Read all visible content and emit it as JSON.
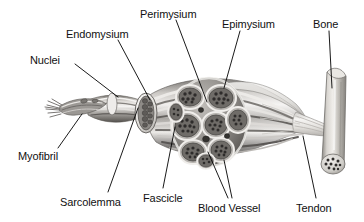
{
  "figure": {
    "style": "grayscale anatomical illustration",
    "background_color": "#ffffff",
    "label_color": "#111111",
    "leader_line_color": "#000000",
    "palette": {
      "muscle_light": "#e6e4e2",
      "muscle_mid": "#9b9894",
      "muscle_dark": "#4a4846",
      "sheath_light": "#f2f1ef",
      "bone_light": "#dcdad6",
      "bone_mid": "#a9a6a1",
      "tendon_light": "#eceae8",
      "outline": "#3d3b39"
    },
    "labels": [
      {
        "id": "nuclei",
        "text": "Nuclei",
        "x": 30,
        "y": 54,
        "leader": [
          [
            75,
            64
          ],
          [
            118,
            97
          ]
        ],
        "points_to": "nuclei on muscle fiber surface"
      },
      {
        "id": "endomysium",
        "text": "Endomysium",
        "x": 66,
        "y": 28,
        "leader": [
          [
            118,
            40
          ],
          [
            150,
            100
          ]
        ],
        "points_to": "endomysium sheath around muscle fiber"
      },
      {
        "id": "perimysium",
        "text": "Perimysium",
        "x": 140,
        "y": 8,
        "leader": [
          [
            176,
            20
          ],
          [
            207,
            102
          ]
        ],
        "points_to": "perimysium surrounding a fascicle"
      },
      {
        "id": "epimysium",
        "text": "Epimysium",
        "x": 222,
        "y": 18,
        "leader": [
          [
            240,
            31
          ],
          [
            224,
            88
          ]
        ],
        "points_to": "epimysium outer sheath of whole muscle"
      },
      {
        "id": "bone",
        "text": "Bone",
        "x": 313,
        "y": 18,
        "leader": [
          [
            329,
            31
          ],
          [
            332,
            88
          ]
        ],
        "points_to": "bone shaft"
      },
      {
        "id": "myofibril",
        "text": "Myofibril",
        "x": 18,
        "y": 150,
        "leader": [
          [
            58,
            148
          ],
          [
            82,
            114
          ]
        ],
        "points_to": "frayed myofibril tip"
      },
      {
        "id": "sarcolemma",
        "text": "Sarcolemma",
        "x": 60,
        "y": 196,
        "leader": [
          [
            108,
            192
          ],
          [
            138,
            108
          ]
        ],
        "points_to": "sarcolemma membrane of muscle fiber"
      },
      {
        "id": "fascicle",
        "text": "Fascicle",
        "x": 143,
        "y": 192,
        "leader": [
          [
            163,
            188
          ],
          [
            175,
            127
          ]
        ],
        "points_to": "fascicle bundle"
      },
      {
        "id": "blood-vessel",
        "text": "Blood Vessel",
        "x": 198,
        "y": 202,
        "leader": [
          [
            228,
            198
          ],
          [
            208,
            152
          ]
        ],
        "leader2": [
          [
            232,
            198
          ],
          [
            224,
            160
          ]
        ],
        "points_to": "blood vessels between fascicles"
      },
      {
        "id": "tendon",
        "text": "Tendon",
        "x": 296,
        "y": 202,
        "leader": [
          [
            316,
            198
          ],
          [
            303,
            136
          ]
        ],
        "points_to": "tendon attaching muscle to bone"
      }
    ]
  }
}
